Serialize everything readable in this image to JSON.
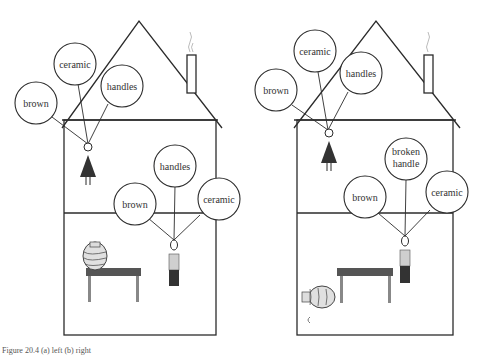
{
  "caption": "Figure 20.4  (a) left   (b) right",
  "left_house": {
    "woman_balloons": [
      "brown",
      "ceramic",
      "handles"
    ],
    "man_balloons": [
      "brown",
      "handles",
      "ceramic"
    ],
    "vase_state": "upright on table"
  },
  "right_house": {
    "woman_balloons": [
      "brown",
      "ceramic",
      "handles"
    ],
    "man_balloons": [
      "brown",
      "broken handle",
      "ceramic"
    ],
    "man_balloon_broken_line1": "broken",
    "man_balloon_broken_line2": "handle",
    "vase_state": "fallen on floor, handle broken off"
  },
  "colors": {
    "line": "#2b2b2b",
    "dress": "#3a3a3a",
    "table_top": "#555555",
    "table_legs": "#888888",
    "shirt": "#cfcfcf",
    "pants": "#333333"
  }
}
